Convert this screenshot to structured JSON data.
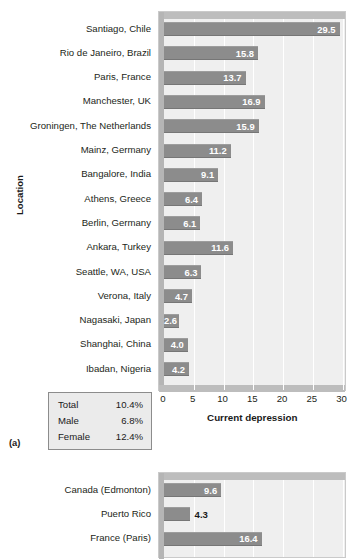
{
  "panel_tag": "(a)",
  "summary": {
    "rows": [
      {
        "key": "Total",
        "value": "10.4%"
      },
      {
        "key": "Male",
        "value": "6.8%"
      },
      {
        "key": "Female",
        "value": "12.4%"
      }
    ]
  },
  "chart_data": [
    {
      "id": "chart-a",
      "type": "bar",
      "orientation": "horizontal",
      "title": "",
      "xlabel": "Current depression",
      "ylabel": "Location",
      "xlim": [
        0,
        30
      ],
      "xticks": [
        0,
        5,
        10,
        15,
        20,
        25,
        30
      ],
      "xtick_labels": [
        "0",
        "5",
        "10",
        "15",
        "20",
        "25",
        "30"
      ],
      "grid": true,
      "grid_axis": "x",
      "legend": false,
      "bar_color": "#8c8c8c",
      "plot_bg": "#efefef",
      "categories": [
        "Santiago, Chile",
        "Rio de Janeiro, Brazil",
        "Paris, France",
        "Manchester, UK",
        "Groningen, The Netherlands",
        "Mainz, Germany",
        "Bangalore, India",
        "Athens, Greece",
        "Berlin, Germany",
        "Ankara, Turkey",
        "Seattle, WA, USA",
        "Verona, Italy",
        "Nagasaki, Japan",
        "Shanghai, China",
        "Ibadan, Nigeria"
      ],
      "values": [
        29.5,
        15.8,
        13.7,
        16.9,
        15.9,
        11.2,
        9.1,
        6.4,
        6.1,
        11.6,
        6.3,
        4.7,
        2.6,
        4.0,
        4.2
      ],
      "value_labels": [
        "29.5",
        "15.8",
        "13.7",
        "16.9",
        "15.9",
        "11.2",
        "9.1",
        "6.4",
        "6.1",
        "11.6",
        "6.3",
        "4.7",
        "2.6",
        "4.0",
        "4.2"
      ],
      "label_placement": [
        "inside",
        "inside",
        "inside",
        "inside",
        "inside",
        "inside",
        "inside",
        "inside",
        "inside",
        "inside",
        "inside",
        "inside",
        "inside",
        "inside",
        "inside"
      ]
    },
    {
      "id": "chart-b",
      "type": "bar",
      "orientation": "horizontal",
      "title": "",
      "xlabel": "",
      "ylabel": "",
      "xlim": [
        0,
        30
      ],
      "xticks": [
        0,
        5,
        10,
        15,
        20,
        25,
        30
      ],
      "grid": true,
      "grid_axis": "x",
      "legend": false,
      "bar_color": "#8c8c8c",
      "plot_bg": "#efefef",
      "categories": [
        "Canada (Edmonton)",
        "Puerto Rico",
        "France (Paris)"
      ],
      "values": [
        9.6,
        4.3,
        16.4
      ],
      "value_labels": [
        "9.6",
        "4.3",
        "16.4"
      ],
      "label_placement": [
        "inside",
        "outside",
        "inside"
      ]
    }
  ]
}
